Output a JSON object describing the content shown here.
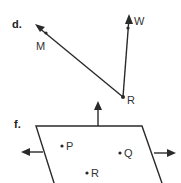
{
  "figures": {
    "d": {
      "label": "d.",
      "vertex": {
        "name": "R",
        "label": "R"
      },
      "rays": [
        {
          "name": "RM",
          "end_label": "M"
        },
        {
          "name": "RW",
          "end_label": "W"
        }
      ]
    },
    "f": {
      "label": "f.",
      "shape": "plane",
      "points": [
        {
          "label": "P"
        },
        {
          "label": "Q"
        },
        {
          "label": "R"
        }
      ],
      "arrows": [
        "up",
        "left",
        "right"
      ]
    }
  }
}
